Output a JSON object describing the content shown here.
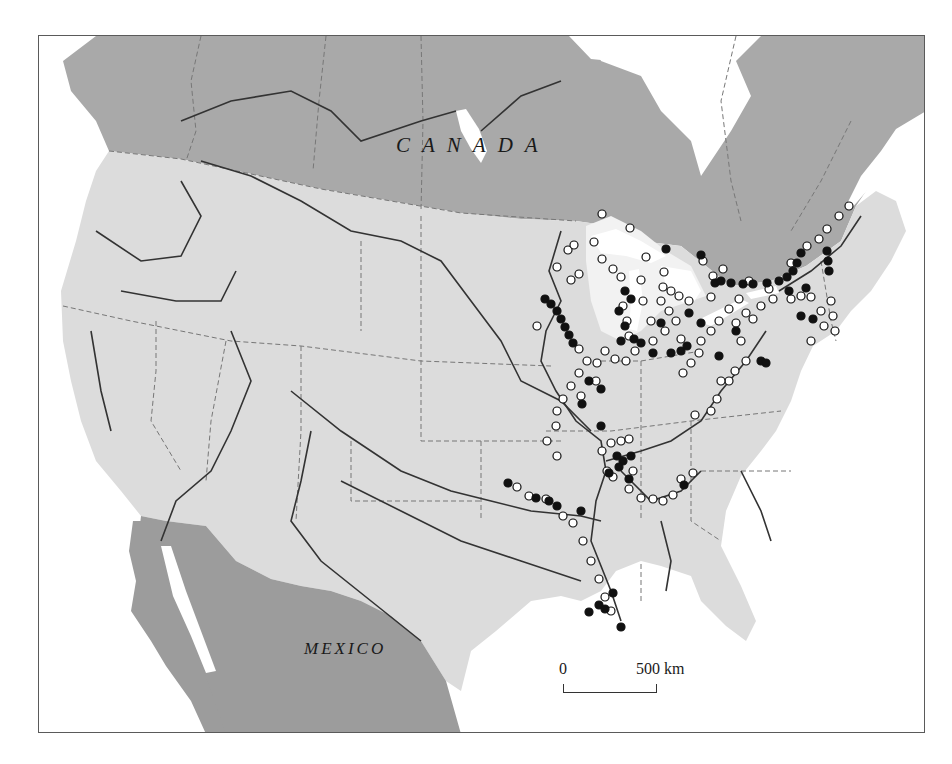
{
  "map": {
    "labels": {
      "canada": "CANADA",
      "mexico": "MEXICO"
    },
    "scale_bar": {
      "start_label": "0",
      "end_label": "500 km"
    },
    "legend_symbols": {
      "filled_circle": "black-site-marker",
      "open_circle": "white-site-marker"
    },
    "colors": {
      "canada_fill": "#a9a9a9",
      "mexico_fill": "#9c9c9c",
      "usa_fill": "#dcdcdc",
      "water": "#ffffff",
      "great_lakes_basin": "#f2f2f2",
      "river_stroke": "#333333",
      "state_boundary": "#777777",
      "marker_filled": "#111111",
      "marker_open": "#ffffff"
    }
  }
}
